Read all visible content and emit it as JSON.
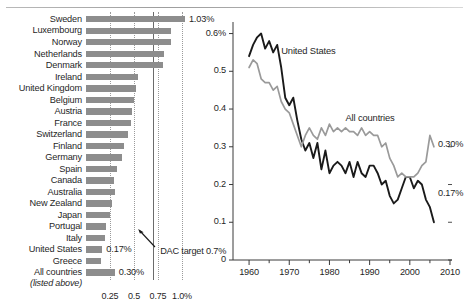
{
  "figure": {
    "name": "foreign-aid-two-panel-figure",
    "accent_bar": "#8d8d8d",
    "accent_us_line": "#1a1a1a",
    "accent_all_line": "#9a9a9a"
  },
  "bar_panel": {
    "axis_unit": "%",
    "annotation": {
      "text": "DAC target 0.7%",
      "target_value": 0.7
    },
    "sub_label": "(listed above)",
    "ticks": [
      "0.25",
      "0.5",
      "0.75",
      "1.0%"
    ]
  },
  "line_panel": {
    "y_ticks": [
      "0.6%",
      "0.5",
      "0.4",
      "0.3",
      "0.2",
      "0.1",
      "0"
    ],
    "x_ticks": [
      "1960",
      "1970",
      "1980",
      "1990",
      "2000",
      "2010"
    ],
    "series_labels": {
      "us": "United States",
      "all": "All countries"
    },
    "end_values": {
      "all": "0.30%",
      "us": "0.17%"
    }
  },
  "chart_data": [
    {
      "type": "bar",
      "title": "Official development assistance as share of gross national income",
      "xlabel": "",
      "ylabel": "",
      "orientation": "horizontal",
      "xlim": [
        0,
        1.12
      ],
      "grid": true,
      "gridlines": [
        0.25,
        0.5,
        0.75,
        1.0
      ],
      "target_line": 0.7,
      "annotations": [
        {
          "text": "DAC target 0.7%",
          "value": 0.7
        }
      ],
      "categories": [
        "Sweden",
        "Luxembourg",
        "Norway",
        "Netherlands",
        "Denmark",
        "Ireland",
        "United Kingdom",
        "Belgium",
        "Austria",
        "France",
        "Switzerland",
        "Finland",
        "Germany",
        "Spain",
        "Canada",
        "Australia",
        "New Zealand",
        "Japan",
        "Portugal",
        "Italy",
        "United States",
        "Greece",
        "All countries"
      ],
      "values": [
        1.03,
        0.89,
        0.89,
        0.81,
        0.8,
        0.54,
        0.52,
        0.5,
        0.48,
        0.47,
        0.44,
        0.4,
        0.37,
        0.32,
        0.29,
        0.3,
        0.27,
        0.25,
        0.21,
        0.2,
        0.17,
        0.16,
        0.3
      ],
      "data_labels": [
        {
          "category": "Sweden",
          "text": "1.03%"
        },
        {
          "category": "United States",
          "text": "0.17%"
        },
        {
          "category": "All countries",
          "text": "0.30%"
        }
      ]
    },
    {
      "type": "line",
      "title": "",
      "xlabel": "",
      "ylabel": "",
      "xlim": [
        1956,
        2010
      ],
      "ylim": [
        0,
        0.62
      ],
      "grid": false,
      "legend": "inline-labels",
      "x": [
        1960,
        1961,
        1962,
        1963,
        1964,
        1965,
        1966,
        1967,
        1968,
        1969,
        1970,
        1971,
        1972,
        1973,
        1974,
        1975,
        1976,
        1977,
        1978,
        1979,
        1980,
        1981,
        1982,
        1983,
        1984,
        1985,
        1986,
        1987,
        1988,
        1989,
        1990,
        1991,
        1992,
        1993,
        1994,
        1995,
        1996,
        1997,
        1998,
        1999,
        2000,
        2001,
        2002,
        2003,
        2004,
        2005,
        2006
      ],
      "series": [
        {
          "name": "United States",
          "color": "#1a1a1a",
          "end_label": "0.17%",
          "values": [
            0.54,
            0.57,
            0.59,
            0.6,
            0.56,
            0.58,
            0.55,
            0.57,
            0.51,
            0.43,
            0.41,
            0.43,
            0.37,
            0.32,
            0.29,
            0.31,
            0.27,
            0.31,
            0.24,
            0.29,
            0.23,
            0.25,
            0.26,
            0.25,
            0.23,
            0.26,
            0.22,
            0.26,
            0.23,
            0.22,
            0.25,
            0.25,
            0.23,
            0.2,
            0.21,
            0.17,
            0.15,
            0.16,
            0.19,
            0.22,
            0.22,
            0.19,
            0.21,
            0.2,
            0.16,
            0.14,
            0.1,
            0.09,
            0.1,
            0.1,
            0.1,
            0.11,
            0.13,
            0.15,
            0.17,
            0.21,
            0.17
          ]
        },
        {
          "name": "All countries",
          "color": "#9a9a9a",
          "end_label": "0.30%",
          "values": [
            0.51,
            0.53,
            0.52,
            0.48,
            0.47,
            0.47,
            0.45,
            0.46,
            0.42,
            0.4,
            0.39,
            0.36,
            0.33,
            0.3,
            0.33,
            0.35,
            0.33,
            0.32,
            0.35,
            0.33,
            0.36,
            0.34,
            0.35,
            0.34,
            0.35,
            0.34,
            0.34,
            0.33,
            0.35,
            0.33,
            0.34,
            0.33,
            0.33,
            0.3,
            0.31,
            0.27,
            0.25,
            0.22,
            0.23,
            0.22,
            0.22,
            0.22,
            0.23,
            0.25,
            0.26,
            0.33,
            0.3
          ]
        }
      ]
    }
  ]
}
